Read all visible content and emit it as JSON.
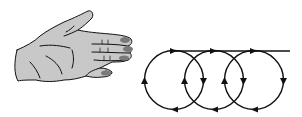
{
  "diagram": {
    "colors": {
      "skin": "#c8c8c8",
      "nail": "#7a7a7a",
      "stroke": "#111111",
      "background": "#ffffff"
    },
    "hand": {
      "icon": "right-hand-icon",
      "orientation": "palm-side, fingers pointing right"
    },
    "trajectory": {
      "tangent_line_y": 51,
      "line_end_x": 290,
      "circles": [
        {
          "cx": 174,
          "cy": 80,
          "r": 30
        },
        {
          "cx": 214,
          "cy": 80,
          "r": 30
        },
        {
          "cx": 254,
          "cy": 80,
          "r": 30
        }
      ],
      "direction": "clockwise"
    }
  }
}
